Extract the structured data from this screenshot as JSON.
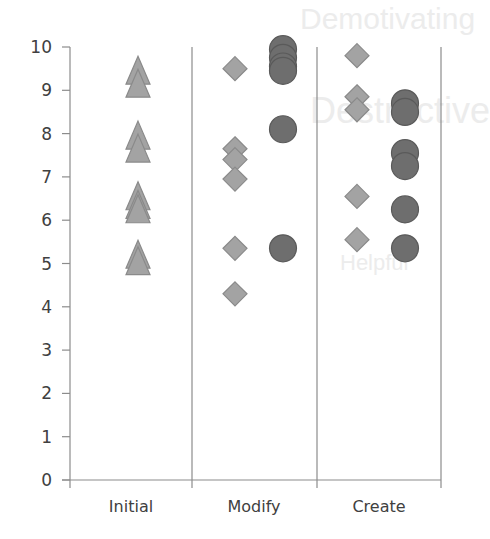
{
  "chart_data": {
    "type": "scatter",
    "title": "",
    "xlabel": "",
    "ylabel": "",
    "ylim": [
      0,
      10
    ],
    "yticks": [
      0,
      1,
      2,
      3,
      4,
      5,
      6,
      7,
      8,
      9,
      10
    ],
    "grid": false,
    "legend": null,
    "categories": [
      "Initial",
      "Modify",
      "Create"
    ],
    "series": [
      {
        "name": "triangle",
        "marker": "triangle",
        "color": "#a3a3a3",
        "edge": "#8a8a8a",
        "points": [
          {
            "category": "Initial",
            "y": 9.4
          },
          {
            "category": "Initial",
            "y": 9.1
          },
          {
            "category": "Initial",
            "y": 7.9
          },
          {
            "category": "Initial",
            "y": 7.6
          },
          {
            "category": "Initial",
            "y": 6.5
          },
          {
            "category": "Initial",
            "y": 6.3
          },
          {
            "category": "Initial",
            "y": 6.2
          },
          {
            "category": "Initial",
            "y": 5.15
          },
          {
            "category": "Initial",
            "y": 5.0
          }
        ]
      },
      {
        "name": "diamond",
        "marker": "diamond",
        "color": "#a3a3a3",
        "edge": "#8a8a8a",
        "points": [
          {
            "category": "Modify",
            "y": 9.5
          },
          {
            "category": "Modify",
            "y": 7.65
          },
          {
            "category": "Modify",
            "y": 7.4
          },
          {
            "category": "Modify",
            "y": 6.95
          },
          {
            "category": "Modify",
            "y": 5.35
          },
          {
            "category": "Modify",
            "y": 4.3
          },
          {
            "category": "Create",
            "y": 9.8
          },
          {
            "category": "Create",
            "y": 8.85
          },
          {
            "category": "Create",
            "y": 8.55
          },
          {
            "category": "Create",
            "y": 6.55
          },
          {
            "category": "Create",
            "y": 5.55
          }
        ]
      },
      {
        "name": "circle",
        "marker": "circle",
        "color": "#6e6e6e",
        "edge": "#5a5a5a",
        "points": [
          {
            "category": "Modify",
            "y": 9.95
          },
          {
            "category": "Modify",
            "y": 9.75
          },
          {
            "category": "Modify",
            "y": 9.55
          },
          {
            "category": "Modify",
            "y": 9.45
          },
          {
            "category": "Modify",
            "y": 8.1
          },
          {
            "category": "Modify",
            "y": 5.35
          },
          {
            "category": "Create",
            "y": 8.7
          },
          {
            "category": "Create",
            "y": 8.5
          },
          {
            "category": "Create",
            "y": 7.55
          },
          {
            "category": "Create",
            "y": 7.25
          },
          {
            "category": "Create",
            "y": 6.25
          },
          {
            "category": "Create",
            "y": 5.35
          }
        ]
      }
    ]
  },
  "layout": {
    "plot_left": 70,
    "plot_right": 441,
    "y_top_px": 47,
    "y_zero_px": 480,
    "dividers_x": [
      192,
      317,
      441
    ],
    "category_centers_x": [
      131,
      254,
      379
    ],
    "marker_x": {
      "Initial": {
        "triangle": 138
      },
      "Modify": {
        "diamond": 235,
        "circle": 283
      },
      "Create": {
        "diamond": 357,
        "circle": 405
      }
    },
    "axis_color": "#8c8c8c",
    "text_color": "#404040"
  },
  "background_bleed": [
    {
      "text": "Demotivating",
      "x": 300,
      "y": 2,
      "size": 30
    },
    {
      "text": "Destructive",
      "x": 310,
      "y": 90,
      "size": 36
    },
    {
      "text": "Helpful",
      "x": 340,
      "y": 250,
      "size": 22
    }
  ]
}
